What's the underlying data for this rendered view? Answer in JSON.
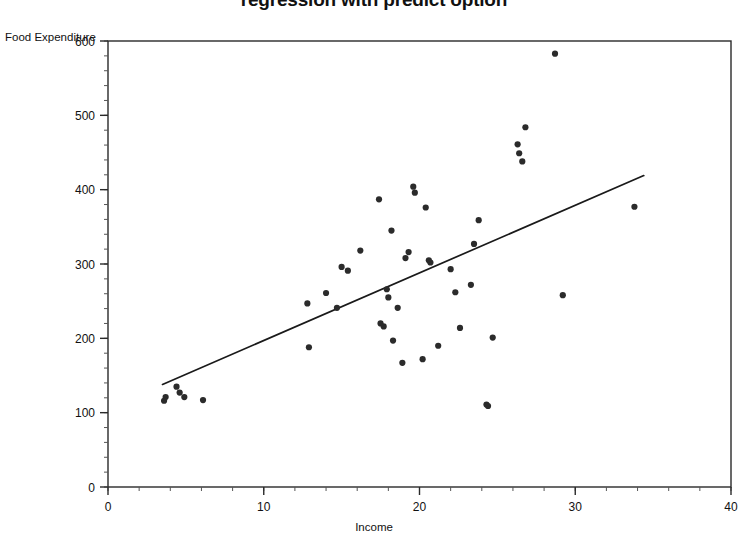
{
  "title": "regression with predict option",
  "axes": {
    "ylabel": "Food Expenditure",
    "xlabel": "Income",
    "x_ticks": [
      "0",
      "10",
      "20",
      "30",
      "40"
    ],
    "y_ticks": [
      "0",
      "100",
      "200",
      "300",
      "400",
      "500",
      "600"
    ]
  },
  "colors": {
    "point": "#2b2b2b",
    "line": "#1a1a1a",
    "axis": "#2a2a2a",
    "background": "#ffffff"
  },
  "chart_data": {
    "type": "scatter",
    "title": "regression with predict option",
    "xlabel": "Income",
    "ylabel": "Food Expenditure",
    "xlim": [
      0,
      40
    ],
    "ylim": [
      0,
      600
    ],
    "xticks": [
      0,
      10,
      20,
      30,
      40
    ],
    "yticks": [
      0,
      100,
      200,
      300,
      400,
      500,
      600
    ],
    "grid": false,
    "legend": false,
    "x_minor_tick_step": 2,
    "y_minor_tick_step": 20,
    "series": [
      {
        "name": "observations",
        "marker": "filled-circle",
        "color": "#2b2b2b",
        "points": [
          [
            3.6,
            116
          ],
          [
            3.7,
            121
          ],
          [
            4.4,
            135
          ],
          [
            4.6,
            127
          ],
          [
            4.9,
            121
          ],
          [
            6.1,
            117
          ],
          [
            12.8,
            247
          ],
          [
            12.9,
            188
          ],
          [
            14.0,
            261
          ],
          [
            14.7,
            241
          ],
          [
            15.0,
            296
          ],
          [
            15.4,
            291
          ],
          [
            16.2,
            318
          ],
          [
            17.4,
            387
          ],
          [
            17.5,
            220
          ],
          [
            17.7,
            216
          ],
          [
            17.9,
            266
          ],
          [
            18.0,
            255
          ],
          [
            18.2,
            345
          ],
          [
            18.3,
            197
          ],
          [
            18.6,
            241
          ],
          [
            18.9,
            167
          ],
          [
            19.1,
            308
          ],
          [
            19.3,
            316
          ],
          [
            19.6,
            404
          ],
          [
            19.7,
            396
          ],
          [
            20.2,
            172
          ],
          [
            20.4,
            376
          ],
          [
            20.6,
            305
          ],
          [
            20.7,
            302
          ],
          [
            21.2,
            190
          ],
          [
            22.0,
            293
          ],
          [
            22.3,
            262
          ],
          [
            22.6,
            214
          ],
          [
            23.3,
            272
          ],
          [
            23.5,
            327
          ],
          [
            23.8,
            359
          ],
          [
            24.3,
            111
          ],
          [
            24.4,
            109
          ],
          [
            24.7,
            201
          ],
          [
            26.3,
            461
          ],
          [
            26.4,
            449
          ],
          [
            26.6,
            438
          ],
          [
            26.8,
            484
          ],
          [
            28.7,
            583
          ],
          [
            29.2,
            258
          ],
          [
            33.8,
            377
          ]
        ]
      }
    ],
    "fit_line": {
      "name": "predicted regression line",
      "color": "#1a1a1a",
      "x_start": 3.5,
      "y_start": 138,
      "x_end": 34.4,
      "y_end": 419
    }
  }
}
